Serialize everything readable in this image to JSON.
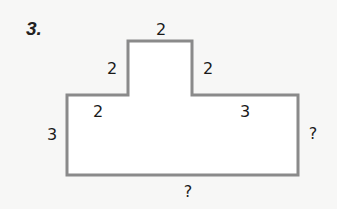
{
  "problem_number": "3.",
  "shape": {
    "stroke_color": "#8a8a8a",
    "vertices": [
      [
        67,
        95
      ],
      [
        128,
        95
      ],
      [
        128,
        41
      ],
      [
        192,
        41
      ],
      [
        192,
        95
      ],
      [
        298,
        95
      ],
      [
        298,
        175
      ],
      [
        67,
        175
      ]
    ]
  },
  "labels": {
    "top": "2",
    "left_step": "2",
    "right_step": "2",
    "lower_left_top": "2",
    "lower_right_top": "3",
    "left_side": "3",
    "right_side": "?",
    "bottom": "?"
  }
}
